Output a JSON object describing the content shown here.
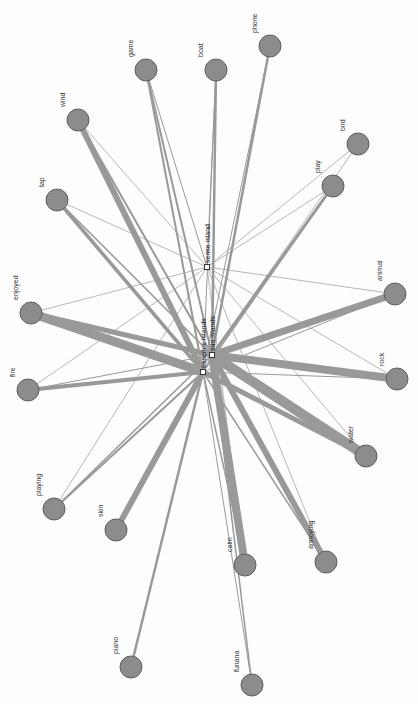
{
  "graph": {
    "title": "",
    "node_color": "#8c8c8c",
    "node_stroke": "#5e5e5e",
    "edge_color": "#999999",
    "background": "#fdfdfd",
    "hubs": [
      {
        "id": "essence",
        "label": "essence islands",
        "x": 203,
        "y": 372
      },
      {
        "id": "sun",
        "label": "sun islands",
        "x": 212,
        "y": 355
      },
      {
        "id": "sense",
        "label": "sense island",
        "x": 207,
        "y": 267
      }
    ],
    "nodes": [
      {
        "id": "game",
        "label": "game",
        "x": 146,
        "y": 70
      },
      {
        "id": "boat",
        "label": "boat",
        "x": 216,
        "y": 70
      },
      {
        "id": "phone",
        "label": "phone",
        "x": 270,
        "y": 46
      },
      {
        "id": "wind",
        "label": "wind",
        "x": 78,
        "y": 120
      },
      {
        "id": "bird",
        "label": "bird",
        "x": 358,
        "y": 144
      },
      {
        "id": "play",
        "label": "play",
        "x": 333,
        "y": 186
      },
      {
        "id": "tap",
        "label": "tap",
        "x": 57,
        "y": 200
      },
      {
        "id": "enjoyed",
        "label": "enjoyed",
        "x": 31,
        "y": 313
      },
      {
        "id": "animal",
        "label": "animal",
        "x": 395,
        "y": 294
      },
      {
        "id": "fire",
        "label": "fire",
        "x": 28,
        "y": 390
      },
      {
        "id": "rock",
        "label": "rock",
        "x": 397,
        "y": 379
      },
      {
        "id": "water",
        "label": "water",
        "x": 366,
        "y": 456
      },
      {
        "id": "playing",
        "label": "playing",
        "x": 54,
        "y": 509
      },
      {
        "id": "skin",
        "label": "skin",
        "x": 116,
        "y": 530
      },
      {
        "id": "calm",
        "label": "calm",
        "x": 245,
        "y": 565
      },
      {
        "id": "annoying",
        "label": "annoying",
        "x": 326,
        "y": 562
      },
      {
        "id": "piano",
        "label": "piano",
        "x": 131,
        "y": 667
      },
      {
        "id": "funana",
        "label": "funana",
        "x": 252,
        "y": 685
      }
    ],
    "edges": [
      {
        "from": "essence",
        "to": "game",
        "w": 2
      },
      {
        "from": "sun",
        "to": "game",
        "w": 2
      },
      {
        "from": "sense",
        "to": "game",
        "w": 1
      },
      {
        "from": "essence",
        "to": "boat",
        "w": 1
      },
      {
        "from": "sun",
        "to": "boat",
        "w": 2.5
      },
      {
        "from": "sense",
        "to": "boat",
        "w": 1
      },
      {
        "from": "sun",
        "to": "phone",
        "w": 2.5
      },
      {
        "from": "essence",
        "to": "phone",
        "w": 1
      },
      {
        "from": "essence",
        "to": "wind",
        "w": 6
      },
      {
        "from": "sun",
        "to": "wind",
        "w": 2
      },
      {
        "from": "sense",
        "to": "wind",
        "w": 0.7
      },
      {
        "from": "sun",
        "to": "bird",
        "w": 0.7
      },
      {
        "from": "sense",
        "to": "bird",
        "w": 0.7
      },
      {
        "from": "sun",
        "to": "play",
        "w": 3
      },
      {
        "from": "essence",
        "to": "play",
        "w": 1.5
      },
      {
        "from": "sense",
        "to": "play",
        "w": 0.7
      },
      {
        "from": "essence",
        "to": "tap",
        "w": 3.5
      },
      {
        "from": "sun",
        "to": "tap",
        "w": 1.5
      },
      {
        "from": "sense",
        "to": "tap",
        "w": 0.7
      },
      {
        "from": "essence",
        "to": "enjoyed",
        "w": 9
      },
      {
        "from": "sun",
        "to": "enjoyed",
        "w": 5
      },
      {
        "from": "sense",
        "to": "enjoyed",
        "w": 0.7
      },
      {
        "from": "sun",
        "to": "animal",
        "w": 7
      },
      {
        "from": "essence",
        "to": "animal",
        "w": 1
      },
      {
        "from": "sense",
        "to": "animal",
        "w": 0.7
      },
      {
        "from": "essence",
        "to": "fire",
        "w": 4
      },
      {
        "from": "sun",
        "to": "fire",
        "w": 1
      },
      {
        "from": "sense",
        "to": "fire",
        "w": 0.7
      },
      {
        "from": "sun",
        "to": "rock",
        "w": 8
      },
      {
        "from": "essence",
        "to": "rock",
        "w": 1
      },
      {
        "from": "sense",
        "to": "rock",
        "w": 0.7
      },
      {
        "from": "sun",
        "to": "water",
        "w": 10
      },
      {
        "from": "essence",
        "to": "water",
        "w": 5
      },
      {
        "from": "sense",
        "to": "water",
        "w": 0.7
      },
      {
        "from": "essence",
        "to": "playing",
        "w": 2
      },
      {
        "from": "sun",
        "to": "playing",
        "w": 1.5
      },
      {
        "from": "sense",
        "to": "playing",
        "w": 0.7
      },
      {
        "from": "essence",
        "to": "skin",
        "w": 6
      },
      {
        "from": "sun",
        "to": "skin",
        "w": 1
      },
      {
        "from": "sun",
        "to": "calm",
        "w": 8
      },
      {
        "from": "essence",
        "to": "calm",
        "w": 1.5
      },
      {
        "from": "sense",
        "to": "calm",
        "w": 0.7
      },
      {
        "from": "sun",
        "to": "annoying",
        "w": 6
      },
      {
        "from": "essence",
        "to": "annoying",
        "w": 1.5
      },
      {
        "from": "sense",
        "to": "annoying",
        "w": 0.7
      },
      {
        "from": "essence",
        "to": "piano",
        "w": 2.5
      },
      {
        "from": "sun",
        "to": "funana",
        "w": 1.5
      },
      {
        "from": "essence",
        "to": "funana",
        "w": 1
      }
    ]
  }
}
